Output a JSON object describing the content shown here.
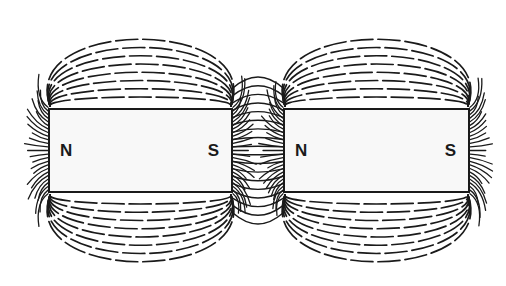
{
  "diagram": {
    "type": "magnetic-field-lines",
    "colors": {
      "line": "#1a1a1a",
      "magnet_fill": "#f8f8f8",
      "background": "#ffffff"
    },
    "magnets": [
      {
        "id": "left",
        "x": 48,
        "y": 108,
        "width": 185,
        "height": 85,
        "left_pole": "N",
        "right_pole": "S"
      },
      {
        "id": "right",
        "x": 283,
        "y": 108,
        "width": 187,
        "height": 85,
        "left_pole": "N",
        "right_pole": "S"
      }
    ]
  }
}
